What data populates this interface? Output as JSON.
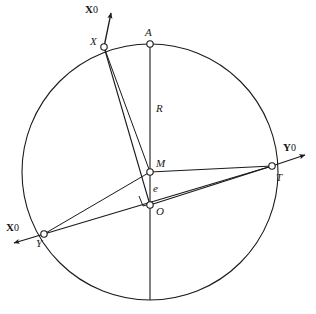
{
  "figure": {
    "background_color": "#ffffff",
    "stroke_color": "#1a1a1a",
    "marker_fill": "#ffffff",
    "width": 316,
    "height": 314
  },
  "labels": {
    "point_a": "A",
    "point_x": "X",
    "point_y": "Y",
    "point_t": "T",
    "point_m": "M",
    "point_o": "O",
    "radius": "R",
    "eccentricity": "e"
  },
  "axes": {
    "x0_upper": {
      "symbol": "X",
      "subscript": "0"
    },
    "y0_right": {
      "symbol": "Y",
      "subscript": "0"
    },
    "x0_lower": {
      "symbol": "X",
      "subscript": "0"
    }
  },
  "geometry": {
    "circle": {
      "cx": 150,
      "cy": 172,
      "r": 128
    },
    "points": {
      "A": {
        "x": 150,
        "y": 44
      },
      "X": {
        "x": 104,
        "y": 47
      },
      "Y": {
        "x": 44,
        "y": 234
      },
      "T": {
        "x": 272,
        "y": 166
      },
      "M": {
        "x": 150,
        "y": 172
      },
      "O": {
        "x": 150,
        "y": 205
      }
    },
    "right_angle_marker": {
      "at": "O",
      "size": 11
    }
  }
}
